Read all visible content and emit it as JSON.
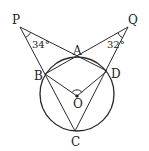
{
  "diagram": {
    "points": {
      "P": {
        "label": "P",
        "x": 20,
        "y": 27
      },
      "Q": {
        "label": "Q",
        "x": 128,
        "y": 27
      },
      "A": {
        "label": "A",
        "x": 77,
        "y": 57
      },
      "B": {
        "label": "B",
        "x": 45,
        "y": 74
      },
      "D": {
        "label": "D",
        "x": 107,
        "y": 71
      },
      "C": {
        "label": "C",
        "x": 75,
        "y": 131
      },
      "O": {
        "label": "O",
        "x": 77,
        "y": 96
      }
    },
    "circle": {
      "center": "O",
      "cx": 77,
      "cy": 94,
      "r": 37
    },
    "angles": {
      "P": {
        "label": "34°",
        "value": 34
      },
      "Q": {
        "label": "32°",
        "value": 32
      },
      "BOD": {
        "label": "",
        "marked": true
      }
    },
    "segments": [
      "PA",
      "PB",
      "PC",
      "QA",
      "QD",
      "QC",
      "AB",
      "AD",
      "OB",
      "OD",
      "BC",
      "DC"
    ],
    "colors": {
      "stroke": "#2a2a2a",
      "background": "#ffffff"
    }
  }
}
